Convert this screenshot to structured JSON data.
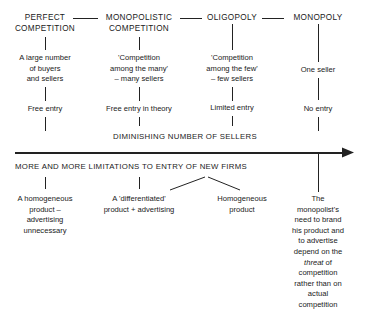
{
  "diagram": {
    "market_structures": [
      {
        "id": "perfect",
        "title_lines": [
          "PERFECT",
          "COMPETITION"
        ],
        "description_lines": [
          "A large number",
          "of buyers",
          "and sellers"
        ],
        "entry": "Free entry",
        "product_lines": [
          "A homogeneous",
          "product –",
          "advertising",
          "unnecessary"
        ]
      },
      {
        "id": "monopolistic",
        "title_lines": [
          "MONOPOLISTIC",
          "COMPETITION"
        ],
        "description_lines": [
          "'Competition",
          "among the many'",
          "– many sellers"
        ],
        "entry": "Free entry in theory",
        "product_lines": [
          "A 'differentiated'",
          "product + advertising"
        ]
      },
      {
        "id": "oligopoly",
        "title_lines": [
          "OLIGOPOLY"
        ],
        "description_lines": [
          "'Competition",
          "among the few'",
          "– few sellers"
        ],
        "entry": "Limited entry",
        "product_lines": [
          "Homogeneous",
          "product"
        ]
      },
      {
        "id": "monopoly",
        "title_lines": [
          "MONOPOLY"
        ],
        "description_lines": [
          "One seller"
        ],
        "entry": "No entry",
        "product_lines": [
          "The",
          "monopolist's",
          "need to brand",
          "his product and",
          "to advertise",
          "depend on the",
          "threat of",
          "competition",
          "rather than on",
          "actual",
          "competition"
        ]
      }
    ],
    "axis": {
      "upper_label": "DIMINISHING NUMBER OF SELLERS",
      "lower_label": "MORE AND MORE LIMITATIONS TO ENTRY OF NEW FIRMS"
    },
    "emphasis_word": "threat",
    "colors": {
      "ink": "#1a1a1a",
      "background": "#ffffff"
    }
  }
}
